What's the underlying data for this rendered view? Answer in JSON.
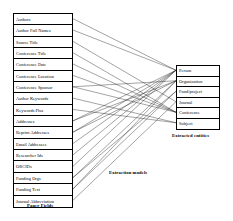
{
  "diagram": {
    "left_panel": {
      "caption": "Paper Fields",
      "fields": [
        {
          "id": "authors",
          "label": "Authors"
        },
        {
          "id": "author-full-names",
          "label": "Author Full Names"
        },
        {
          "id": "source-title",
          "label": "Source Title"
        },
        {
          "id": "conference-title",
          "label": "Conference Title"
        },
        {
          "id": "conference-date",
          "label": "Conference Date"
        },
        {
          "id": "conference-location",
          "label": "Conference Location"
        },
        {
          "id": "conference-sponsor",
          "label": "Conference Sponsor"
        },
        {
          "id": "author-keywords",
          "label": "Author Keywords"
        },
        {
          "id": "keywords-plus",
          "label": "Keywords Plus"
        },
        {
          "id": "addresses",
          "label": "Addresses"
        },
        {
          "id": "reprint-addresses",
          "label": "Reprint Addresses"
        },
        {
          "id": "email-addresses",
          "label": "Email Addresses"
        },
        {
          "id": "researcher-ids",
          "label": "Researcher Ids"
        },
        {
          "id": "orcids",
          "label": "ORCIDs"
        },
        {
          "id": "funding-orgs",
          "label": "Funding Orgs"
        },
        {
          "id": "funding-text",
          "label": "Funding Text"
        },
        {
          "id": "journal-abbreviation",
          "label": "Journal Abbreviation"
        }
      ]
    },
    "right_panel": {
      "caption": "Extracted entities",
      "entities": [
        {
          "id": "person",
          "label": "Person"
        },
        {
          "id": "organization",
          "label": "Organization"
        },
        {
          "id": "fund-project",
          "label": "Fund/project"
        },
        {
          "id": "journal",
          "label": "Journal"
        },
        {
          "id": "conference",
          "label": "Conference"
        },
        {
          "id": "subject",
          "label": "Subject"
        }
      ]
    },
    "middle_caption": "Extraction models",
    "edges": [
      {
        "from": "authors",
        "to": "person"
      },
      {
        "from": "author-full-names",
        "to": "person"
      },
      {
        "from": "source-title",
        "to": "journal"
      },
      {
        "from": "conference-title",
        "to": "conference"
      },
      {
        "from": "conference-date",
        "to": "conference"
      },
      {
        "from": "conference-location",
        "to": "conference"
      },
      {
        "from": "conference-sponsor",
        "to": "conference"
      },
      {
        "from": "conference-sponsor",
        "to": "organization"
      },
      {
        "from": "author-keywords",
        "to": "subject"
      },
      {
        "from": "keywords-plus",
        "to": "subject"
      },
      {
        "from": "addresses",
        "to": "organization"
      },
      {
        "from": "addresses",
        "to": "person"
      },
      {
        "from": "reprint-addresses",
        "to": "organization"
      },
      {
        "from": "reprint-addresses",
        "to": "person"
      },
      {
        "from": "email-addresses",
        "to": "person"
      },
      {
        "from": "researcher-ids",
        "to": "person"
      },
      {
        "from": "orcids",
        "to": "person"
      },
      {
        "from": "funding-orgs",
        "to": "organization"
      },
      {
        "from": "funding-orgs",
        "to": "fund-project"
      },
      {
        "from": "funding-text",
        "to": "fund-project"
      },
      {
        "from": "funding-text",
        "to": "organization"
      },
      {
        "from": "journal-abbreviation",
        "to": "journal"
      }
    ],
    "colors": {
      "stroke": "#1a1a1a",
      "background": "#ffffff",
      "text": "#000000"
    }
  }
}
